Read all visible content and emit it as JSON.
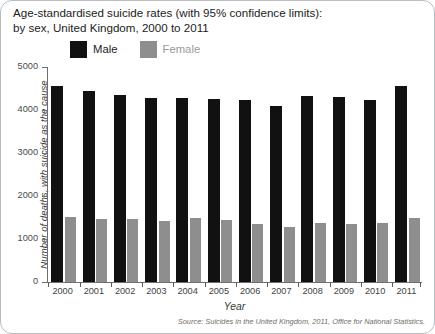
{
  "card": {
    "background": "#ffffff",
    "border_color": "#b9bcc0"
  },
  "title": {
    "line1": "Age-standardised suicide rates (with 95% confidence limits):",
    "line2": "by sex, United Kingdom, 2000 to 2011"
  },
  "legend": {
    "position": "top-left",
    "items": [
      {
        "label": "Male",
        "color": "#111111",
        "swatch_name": "legend-swatch-male"
      },
      {
        "label": "Female",
        "color": "#8e8e8e",
        "swatch_name": "legend-swatch-female"
      }
    ]
  },
  "source": {
    "text": "Source: Suicides in the United Kingdom, 2011, Office for National Statistics."
  },
  "chart_data": {
    "type": "bar",
    "title": "Age-standardised suicide rates (with 95% confidence limits): by sex, United Kingdom, 2000 to 2011",
    "xlabel": "Year",
    "ylabel": "Number of deaths, with suicide as the cause",
    "ylim": [
      0,
      5000
    ],
    "yticks": [
      0,
      1000,
      2000,
      3000,
      4000,
      5000
    ],
    "ytick_labels": [
      "0",
      "1000",
      "2000",
      "3000",
      "4000",
      "5000"
    ],
    "grid": false,
    "legend_position": "top-left",
    "categories": [
      "2000",
      "2001",
      "2002",
      "2003",
      "2004",
      "2005",
      "2006",
      "2007",
      "2008",
      "2009",
      "2010",
      "2011"
    ],
    "series": [
      {
        "name": "Male",
        "color": "#111111",
        "values": [
          4550,
          4450,
          4350,
          4290,
          4290,
          4250,
          4230,
          4100,
          4320,
          4300,
          4240,
          4570
        ]
      },
      {
        "name": "Female",
        "color": "#8e8e8e",
        "values": [
          1520,
          1460,
          1470,
          1430,
          1490,
          1440,
          1360,
          1290,
          1370,
          1360,
          1380,
          1480
        ]
      }
    ]
  }
}
